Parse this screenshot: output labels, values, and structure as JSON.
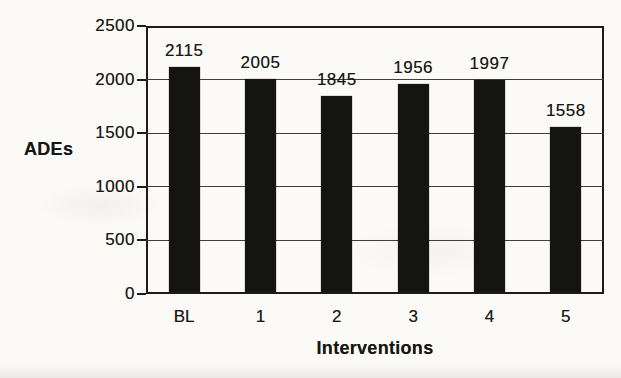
{
  "figure": {
    "kind": "scanned printed bar chart",
    "background_color": "#fbfaf6"
  },
  "chart_data": {
    "type": "bar",
    "title": "",
    "categories": [
      "BL",
      "1",
      "2",
      "3",
      "4",
      "5"
    ],
    "values": [
      2115,
      2005,
      1845,
      1956,
      1997,
      1558
    ],
    "bar_labels": [
      "2115",
      "2005",
      "1845",
      "1956",
      "1997",
      "1558"
    ],
    "xlabel": "Interventions",
    "ylabel": "ADEs",
    "ylim": [
      0,
      2500
    ],
    "yticks": [
      0,
      500,
      1000,
      1500,
      2000,
      2500
    ],
    "ytick_labels": [
      "0",
      "500",
      "1000",
      "1500",
      "2000",
      "2500"
    ],
    "grid": "horizontal",
    "legend": "none",
    "bar_color": "#141413",
    "axis_color": "#1c1c1c",
    "gridline_color": "#3e3e3c",
    "text_color": "#191917"
  }
}
